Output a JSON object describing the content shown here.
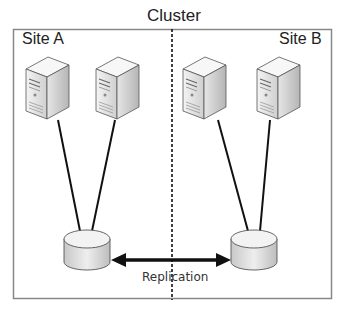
{
  "diagram": {
    "title": "Cluster",
    "sites": [
      {
        "label": "Site A",
        "servers": 2,
        "storage": 1
      },
      {
        "label": "Site B",
        "servers": 2,
        "storage": 1
      }
    ],
    "link_label": "Replication",
    "colors": {
      "border": "#888888",
      "line": "#111111",
      "divider": "#111111"
    }
  }
}
